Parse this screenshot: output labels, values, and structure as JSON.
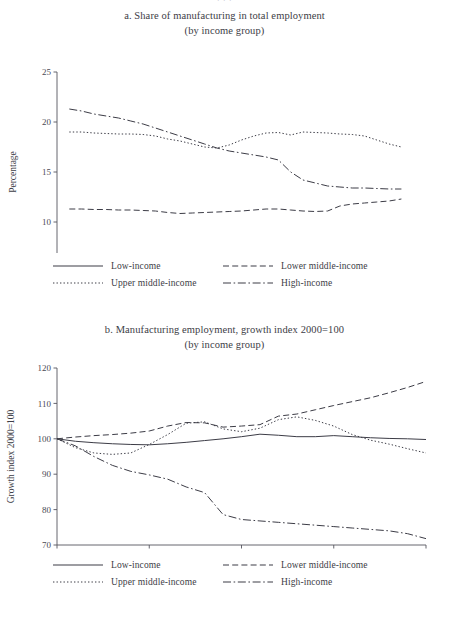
{
  "page": {
    "ghost_top_text": "· · ·",
    "background": "#ffffff",
    "ink": "#3c3c46"
  },
  "legend": {
    "items": [
      {
        "label": "Low-income",
        "style": "solid",
        "key": "low"
      },
      {
        "label": "Lower middle-income",
        "style": "dashed",
        "key": "lower"
      },
      {
        "label": "Upper middle-income",
        "style": "dotted",
        "key": "upper"
      },
      {
        "label": "High-income",
        "style": "dash-dot",
        "key": "high"
      }
    ]
  },
  "chart_data": [
    {
      "id": "panel-a",
      "type": "line",
      "title": "a. Share of manufacturing in total employment",
      "subtitle": "(by income group)",
      "xlabel": "",
      "ylabel": "Percentage",
      "xlim": [
        1990,
        2020
      ],
      "ylim": [
        5,
        25
      ],
      "xticks": [
        1990,
        2000,
        2010,
        2020
      ],
      "yticks": [
        5,
        10,
        15,
        20,
        25
      ],
      "grid": false,
      "legend_position": "below",
      "x": [
        1991,
        1992,
        1993,
        1994,
        1995,
        1996,
        1997,
        1998,
        1999,
        2000,
        2001,
        2002,
        2003,
        2004,
        2005,
        2006,
        2007,
        2008,
        2009,
        2010,
        2011,
        2012,
        2013,
        2014,
        2015,
        2016,
        2017,
        2018
      ],
      "series": [
        {
          "name": "Low-income",
          "style": "solid",
          "values": [
            5.9,
            5.9,
            5.9,
            5.9,
            5.85,
            5.85,
            5.8,
            5.8,
            5.8,
            5.75,
            5.7,
            5.7,
            5.65,
            5.6,
            5.6,
            5.55,
            5.5,
            5.5,
            5.5,
            5.5,
            5.55,
            5.6,
            5.6,
            5.6,
            5.6,
            5.6,
            5.55,
            5.5
          ]
        },
        {
          "name": "Lower middle-income",
          "style": "dashed",
          "values": [
            11.3,
            11.3,
            11.25,
            11.25,
            11.2,
            11.2,
            11.15,
            11.1,
            10.95,
            10.85,
            10.9,
            10.95,
            11.0,
            11.05,
            11.1,
            11.2,
            11.3,
            11.3,
            11.2,
            11.1,
            11.05,
            11.1,
            11.6,
            11.8,
            11.9,
            12.0,
            12.1,
            12.3
          ]
        },
        {
          "name": "Upper middle-income",
          "style": "dotted",
          "values": [
            19.0,
            19.0,
            18.9,
            18.85,
            18.8,
            18.8,
            18.75,
            18.6,
            18.3,
            18.1,
            17.8,
            17.5,
            17.4,
            17.7,
            18.2,
            18.6,
            18.9,
            18.95,
            18.7,
            19.0,
            18.95,
            18.9,
            18.8,
            18.75,
            18.6,
            18.2,
            17.8,
            17.5
          ]
        },
        {
          "name": "High-income",
          "style": "dash-dot",
          "values": [
            21.3,
            21.1,
            20.8,
            20.6,
            20.4,
            20.1,
            19.8,
            19.4,
            19.0,
            18.6,
            18.2,
            17.8,
            17.4,
            17.1,
            16.9,
            16.7,
            16.5,
            16.2,
            15.0,
            14.2,
            13.9,
            13.6,
            13.5,
            13.4,
            13.4,
            13.35,
            13.3,
            13.3
          ]
        }
      ]
    },
    {
      "id": "panel-b",
      "type": "line",
      "title": "b. Manufacturing employment, growth index 2000=100",
      "subtitle": "(by income group)",
      "xlabel": "",
      "ylabel": "Growth index 2000=100",
      "xlim": [
        2000,
        2020
      ],
      "ylim": [
        70,
        120
      ],
      "xticks": [
        2000,
        2005,
        2010,
        2015,
        2020
      ],
      "yticks": [
        70,
        80,
        90,
        100,
        110,
        120
      ],
      "grid": false,
      "legend_position": "below",
      "x": [
        2000,
        2001,
        2002,
        2003,
        2004,
        2005,
        2006,
        2007,
        2008,
        2009,
        2010,
        2011,
        2012,
        2013,
        2014,
        2015,
        2016,
        2017,
        2018,
        2019,
        2020
      ],
      "series": [
        {
          "name": "Low-income",
          "style": "solid",
          "values": [
            100,
            99.3,
            98.9,
            98.6,
            98.4,
            98.3,
            98.6,
            99.0,
            99.5,
            100.0,
            100.6,
            101.3,
            101.0,
            100.6,
            100.6,
            100.9,
            100.6,
            100.3,
            100.1,
            100.0,
            99.8
          ]
        },
        {
          "name": "Lower middle-income",
          "style": "dashed",
          "values": [
            100,
            100.5,
            100.9,
            101.2,
            101.6,
            102.2,
            103.6,
            104.6,
            104.5,
            103.3,
            103.6,
            104.0,
            106.4,
            107.0,
            108.2,
            109.4,
            110.5,
            111.6,
            113.0,
            114.5,
            116.2
          ]
        },
        {
          "name": "Upper middle-income",
          "style": "dotted",
          "values": [
            100,
            97.5,
            96.0,
            95.6,
            96.0,
            98.4,
            101.2,
            104.4,
            104.8,
            102.8,
            102.0,
            103.0,
            105.4,
            106.2,
            105.2,
            103.6,
            101.2,
            99.6,
            98.5,
            97.2,
            96.0
          ]
        },
        {
          "name": "High-income",
          "style": "dash-dot",
          "values": [
            100,
            98.0,
            95.0,
            92.5,
            90.8,
            89.8,
            88.6,
            86.4,
            84.8,
            78.6,
            77.2,
            76.8,
            76.4,
            76.0,
            75.6,
            75.2,
            74.8,
            74.4,
            74.0,
            73.2,
            71.8
          ]
        }
      ]
    }
  ]
}
